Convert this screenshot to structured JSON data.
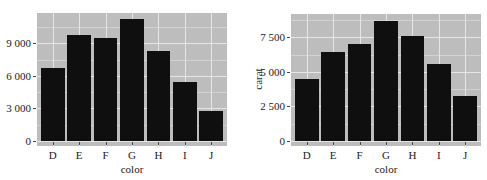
{
  "chart_data": [
    {
      "type": "bar",
      "title": "",
      "xlabel": "color",
      "ylabel": "",
      "categories": [
        "D",
        "E",
        "F",
        "G",
        "H",
        "I",
        "J"
      ],
      "values": [
        6775,
        9797,
        9542,
        11292,
        8304,
        5422,
        2808
      ],
      "ylim": [
        0,
        11800
      ],
      "yticks": [
        0,
        3000,
        6000,
        9000
      ],
      "ytick_labels": [
        "0",
        "3 000",
        "6 000",
        "9 000"
      ],
      "grid": true,
      "legend": null,
      "bar_color": "#0f0f0f",
      "panel_background": "#bdbdbd"
    },
    {
      "type": "bar",
      "title": "",
      "xlabel": "color",
      "ylabel": "carat",
      "categories": [
        "D",
        "E",
        "F",
        "G",
        "H",
        "I",
        "J"
      ],
      "values": [
        4456.56,
        6445.12,
        7028.05,
        8708.28,
        7571.58,
        5568.0,
        3263.28
      ],
      "ylim": [
        0,
        9200
      ],
      "yticks": [
        0,
        2500,
        5000,
        7500
      ],
      "ytick_labels": [
        "0",
        "2 500",
        "5 000",
        "7 500"
      ],
      "grid": true,
      "legend": null,
      "bar_color": "#0f0f0f",
      "panel_background": "#bdbdbd"
    }
  ],
  "charts": [
    {
      "xlabel": "color",
      "ylabel": "",
      "categories": [
        "D",
        "E",
        "F",
        "G",
        "H",
        "I",
        "J"
      ],
      "ytick_labels": [
        "0",
        "3 000",
        "6 000",
        "9 000"
      ]
    },
    {
      "xlabel": "color",
      "ylabel": "carat",
      "categories": [
        "D",
        "E",
        "F",
        "G",
        "H",
        "I",
        "J"
      ],
      "ytick_labels": [
        "0",
        "2 500",
        "5 000",
        "7 500"
      ]
    }
  ]
}
